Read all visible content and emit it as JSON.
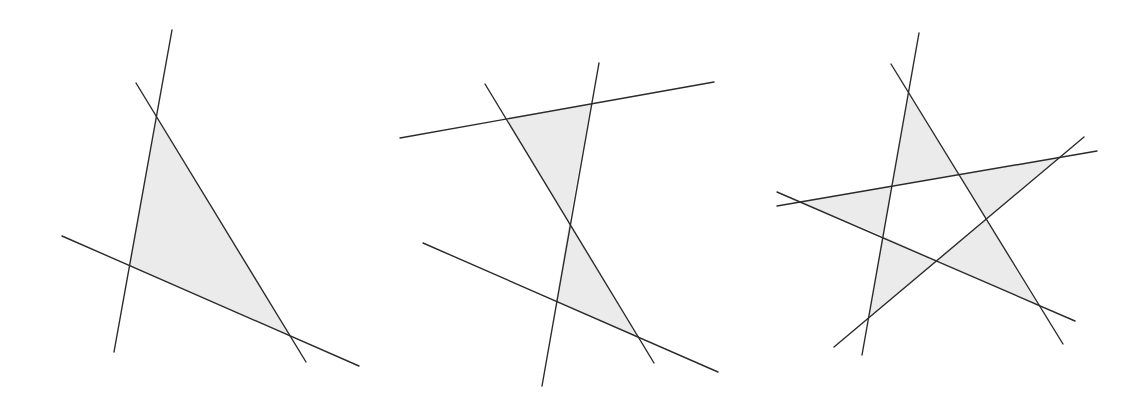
{
  "colors": {
    "background": "#ffffff",
    "line": "#2b2b2b",
    "fill": "#ebebeb"
  },
  "figures": [
    {
      "name": "three-lines-one-triangle",
      "lines": [
        [
          172,
          30,
          114,
          352
        ],
        [
          136,
          83,
          306,
          362
        ],
        [
          62,
          236,
          359,
          366
        ]
      ],
      "regions": [
        "157,117 129,266 288,334"
      ]
    },
    {
      "name": "four-lines-two-triangles",
      "lines": [
        [
          400,
          138,
          714,
          82
        ],
        [
          599,
          63,
          542,
          386
        ],
        [
          485,
          84,
          654,
          363
        ],
        [
          423,
          243,
          718,
          372
        ]
      ],
      "regions": [
        "506,118 591,104 569,223",
        "569,223 556,302 638,338"
      ]
    },
    {
      "name": "five-lines-pentagram",
      "lines": [
        [
          919,
          33,
          862,
          355
        ],
        [
          891,
          64,
          1063,
          344
        ],
        [
          777,
          206,
          1097,
          151
        ],
        [
          777,
          192,
          1075,
          321
        ],
        [
          834,
          347,
          1084,
          137
        ]
      ],
      "regions": [
        "909,94 959,175 892,185",
        "959,175 1059,157 986,219",
        "986,219 1038,306 937,260",
        "937,260 868,318 883,236",
        "883,236 801,202 892,185"
      ]
    }
  ]
}
